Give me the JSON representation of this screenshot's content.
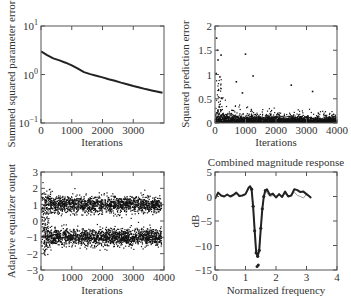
{
  "chart_data": [
    {
      "id": "param_error",
      "type": "line",
      "title": "",
      "xlabel": "Iterations",
      "ylabel": "Summed squared parameter error",
      "yscale": "log",
      "xlim": [
        0,
        4000
      ],
      "ylim": [
        0.1,
        10
      ],
      "xticks": [
        0,
        1000,
        2000,
        3000
      ],
      "xtick_labels": [
        "0",
        "1000",
        "2000",
        "3000"
      ],
      "yticks": [
        0.1,
        1,
        10
      ],
      "ytick_labels": [
        "10^-1",
        "10^0",
        "10^1"
      ],
      "grid": false,
      "series": [
        {
          "name": "parameter error",
          "x": [
            0,
            200,
            400,
            600,
            800,
            1000,
            1200,
            1400,
            1600,
            1800,
            2000,
            2200,
            2400,
            2600,
            2800,
            3000,
            3200,
            3400,
            3600,
            3800,
            3950
          ],
          "y": [
            3.0,
            2.5,
            2.15,
            1.95,
            1.75,
            1.55,
            1.32,
            1.12,
            1.02,
            0.94,
            0.87,
            0.8,
            0.74,
            0.68,
            0.63,
            0.58,
            0.54,
            0.5,
            0.47,
            0.44,
            0.42
          ]
        }
      ]
    },
    {
      "id": "pred_error",
      "type": "scatter",
      "title": "",
      "xlabel": "Iterations",
      "ylabel": "Squared prediction error",
      "xlim": [
        0,
        4000
      ],
      "ylim": [
        0,
        2
      ],
      "xticks": [
        0,
        1000,
        2000,
        3000,
        4000
      ],
      "xtick_labels": [
        "0",
        "1000",
        "2000",
        "3000",
        "4000"
      ],
      "yticks": [
        0,
        0.5,
        1,
        1.5,
        2
      ],
      "ytick_labels": [
        "0",
        "0.5",
        "1",
        "1.5",
        "2"
      ],
      "grid": false,
      "description": "Dense scatter of ~4000 points concentrated near 0 (mostly below 0.3), with outliers up to ~1.75 early on, ~1.42 near 1000, and decaying spread over iterations",
      "notable_points": [
        {
          "x": 50,
          "y": 1.75
        },
        {
          "x": 80,
          "y": 1.5
        },
        {
          "x": 100,
          "y": 1.3
        },
        {
          "x": 200,
          "y": 1.4
        },
        {
          "x": 40,
          "y": 1.02
        },
        {
          "x": 160,
          "y": 0.95
        },
        {
          "x": 1000,
          "y": 1.42
        },
        {
          "x": 1250,
          "y": 0.97
        },
        {
          "x": 700,
          "y": 0.85
        },
        {
          "x": 2500,
          "y": 0.78
        },
        {
          "x": 3200,
          "y": 0.65
        },
        {
          "x": 900,
          "y": 0.62
        }
      ],
      "seed": 7
    },
    {
      "id": "equalizer_output",
      "type": "scatter",
      "title": "",
      "xlabel": "Iterations",
      "ylabel": "Adaptive equalizer output",
      "xlim": [
        0,
        4000
      ],
      "ylim": [
        -3,
        3
      ],
      "xticks": [
        0,
        1000,
        2000,
        3000,
        4000
      ],
      "xtick_labels": [
        "0",
        "1000",
        "2000",
        "3000",
        "4000"
      ],
      "yticks": [
        -3,
        -2,
        -1,
        0,
        1,
        2,
        3
      ],
      "ytick_labels": [
        "−3",
        "−2",
        "−1",
        "0",
        "1",
        "2",
        "3"
      ],
      "grid": false,
      "description": "Two dense bands of points centered at +1 and -1 (spread roughly ±0.5), with wider spread in the first ~300 iterations",
      "clusters": [
        {
          "center": 1.0,
          "spread": 0.35
        },
        {
          "center": -1.0,
          "spread": 0.35
        }
      ],
      "seed": 11
    },
    {
      "id": "magnitude_response",
      "type": "line",
      "title": "Combined magnitude response",
      "xlabel": "Normalized frequency",
      "ylabel": "dB",
      "xlim": [
        0,
        4
      ],
      "ylim": [
        -15,
        5
      ],
      "xticks": [
        0,
        1,
        2,
        3,
        4
      ],
      "xtick_labels": [
        "0",
        "1",
        "2",
        "3",
        "4"
      ],
      "yticks": [
        -15,
        -10,
        -5,
        0,
        5
      ],
      "ytick_labels": [
        "−15",
        "−10",
        "−5",
        "0",
        "5"
      ],
      "grid": false,
      "series": [
        {
          "name": "response A (thick dark)",
          "color": "#222222",
          "width": 2,
          "marker": "dot",
          "x": [
            0,
            0.1,
            0.2,
            0.3,
            0.4,
            0.5,
            0.6,
            0.7,
            0.8,
            0.9,
            1.0,
            1.1,
            1.15,
            1.2,
            1.25,
            1.3,
            1.35,
            1.4,
            1.45,
            1.5,
            1.55,
            1.6,
            1.65,
            1.7,
            1.8,
            1.9,
            2.0,
            2.1,
            2.2,
            2.3,
            2.4,
            2.5,
            2.6,
            2.7,
            2.8,
            2.9,
            3.0,
            3.1,
            3.15
          ],
          "y": [
            -0.5,
            0.8,
            0.2,
            0.0,
            0.4,
            0.0,
            0.3,
            0.8,
            0.1,
            0.2,
            0.5,
            1.8,
            2.1,
            1.5,
            -2.0,
            -7.0,
            -11.5,
            -12.2,
            -11.0,
            -6.5,
            -2.5,
            0.0,
            1.2,
            1.5,
            0.3,
            0.6,
            -0.2,
            0.5,
            -0.1,
            1.0,
            0.0,
            0.2,
            1.5,
            1.3,
            0.9,
            1.0,
            0.5,
            0.0,
            -0.3
          ]
        },
        {
          "name": "response B (thin gray)",
          "color": "#999999",
          "width": 1,
          "x": [
            0,
            0.1,
            0.2,
            0.3,
            0.4,
            0.5,
            0.6,
            0.7,
            0.8,
            0.9,
            1.0,
            1.1,
            1.15,
            1.2,
            1.25,
            1.3,
            1.35,
            1.4,
            1.45,
            1.5,
            1.55,
            1.6,
            1.65,
            1.7,
            1.8,
            1.9,
            2.0,
            2.1,
            2.2,
            2.3,
            2.4,
            2.5,
            2.6,
            2.7,
            2.8,
            2.9,
            3.0,
            3.1,
            3.15
          ],
          "y": [
            -0.3,
            0.6,
            0.2,
            0.0,
            0.3,
            0.1,
            0.2,
            0.6,
            0.1,
            0.2,
            0.4,
            1.6,
            1.9,
            1.3,
            -2.2,
            -7.2,
            -11.8,
            -12.4,
            -11.2,
            -6.7,
            -2.7,
            -0.2,
            1.0,
            0.8,
            0.0,
            0.2,
            0.0,
            0.3,
            0.0,
            0.6,
            0.0,
            0.3,
            0.9,
            0.2,
            0.0,
            -0.3,
            0.5,
            0.1,
            -0.3
          ]
        }
      ],
      "extra_marks": [
        {
          "x": 1.42,
          "y": -14.0
        },
        {
          "x": 1.38,
          "y": -14.3
        }
      ]
    }
  ]
}
